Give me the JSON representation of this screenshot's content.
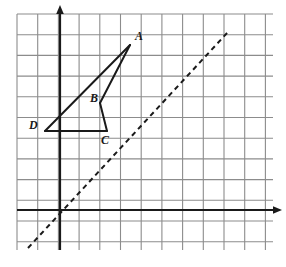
{
  "figure": {
    "kind": "coordinate-grid-geometry-diagram",
    "background_color": "#ffffff",
    "grid": {
      "line_color": "#8c8c8c",
      "line_width": 1.1,
      "spacing_px": 20.7,
      "left_px": 17,
      "top_px": 14,
      "right_px": 273,
      "bottom_px": 250,
      "columns": 13,
      "rows": 12,
      "visible": true
    },
    "axes": {
      "color": "#1a1a1a",
      "line_width": 2.2,
      "origin_px": {
        "x": 60,
        "y": 210
      },
      "x_axis": {
        "name": "x-axis",
        "from_px": {
          "x": 17,
          "y": 210
        },
        "to_px": {
          "x": 277,
          "y": 210
        },
        "arrow": "right"
      },
      "y_axis": {
        "name": "y-axis",
        "from_px": {
          "x": 60,
          "y": 250
        },
        "to_px": {
          "x": 60,
          "y": 10
        },
        "arrow": "up"
      },
      "tick_labels": []
    },
    "dashed_line": {
      "name": "line-of-reflection",
      "color": "#1a1a1a",
      "line_width": 2.0,
      "dash_pattern": "5 4",
      "slope": 1,
      "from_px": {
        "x": 28,
        "y": 248
      },
      "to_px": {
        "x": 228,
        "y": 32
      }
    },
    "shape": {
      "name": "quadrilateral-ABCD",
      "stroke_color": "#1a1a1a",
      "stroke_width": 2.0,
      "fill": "none",
      "path_order": [
        "A",
        "B",
        "C",
        "D"
      ],
      "edges": [
        {
          "from": "D",
          "to": "A"
        },
        {
          "from": "A",
          "to": "B"
        },
        {
          "from": "B",
          "to": "C"
        },
        {
          "from": "C",
          "to": "D"
        }
      ]
    },
    "points": [
      {
        "id": "A",
        "label": "A",
        "px": {
          "x": 130,
          "y": 45
        },
        "grid": {
          "x": 3.4,
          "y": 8.0
        },
        "label_px": {
          "x": 135,
          "y": 30
        }
      },
      {
        "id": "B",
        "label": "B",
        "px": {
          "x": 100,
          "y": 103
        },
        "grid": {
          "x": 1.9,
          "y": 5.2
        },
        "label_px": {
          "x": 90,
          "y": 92
        }
      },
      {
        "id": "C",
        "label": "C",
        "px": {
          "x": 107,
          "y": 131
        },
        "grid": {
          "x": 2.3,
          "y": 3.8
        },
        "label_px": {
          "x": 101,
          "y": 134
        }
      },
      {
        "id": "D",
        "label": "D",
        "px": {
          "x": 45,
          "y": 131
        },
        "grid": {
          "x": -0.7,
          "y": 3.8
        },
        "label_px": {
          "x": 29,
          "y": 119
        }
      }
    ]
  }
}
